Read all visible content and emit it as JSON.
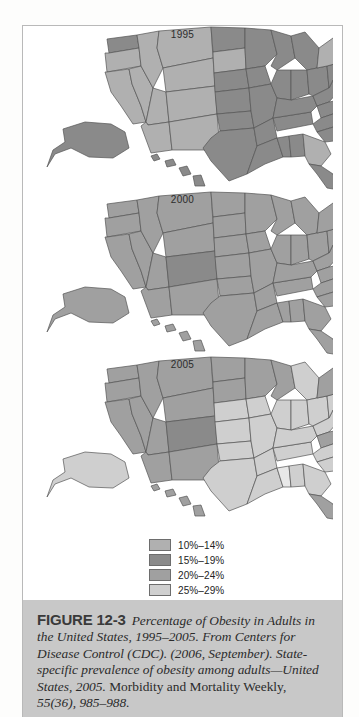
{
  "figure": {
    "number_label": "FIGURE 12-3",
    "caption_italic_1": "Percentage of Obesity in Adults in the United States, 1995–2005. From Centers for Disease Control (CDC). (2006, September). State-specific prevalence of obesity among adults—United States, 2005.",
    "caption_roman_1": " Morbidity and Mortality Weekly, ",
    "caption_italic_2": "55(36), 985–988."
  },
  "maps": [
    {
      "year": "1995"
    },
    {
      "year": "2000"
    },
    {
      "year": "2005"
    }
  ],
  "legend": {
    "items": [
      {
        "label": "10%–14%",
        "color": "#b0b0b0"
      },
      {
        "label": "15%–19%",
        "color": "#8a8a8a"
      },
      {
        "label": "20%–24%",
        "color": "#a0a0a0"
      },
      {
        "label": "25%–29%",
        "color": "#cfcfcf"
      },
      {
        "label": "≥30%",
        "color": "#e8e8e8"
      }
    ]
  },
  "map_data": {
    "type": "choropleth",
    "title": "Percentage of Obesity in Adults in the United States, 1995–2005",
    "region": "United States",
    "categories": [
      "10%–14%",
      "15%–19%",
      "20%–24%",
      "25%–29%",
      "≥30%"
    ],
    "colors": [
      "#b0b0b0",
      "#8a8a8a",
      "#a0a0a0",
      "#cfcfcf",
      "#e8e8e8"
    ],
    "frames": [
      {
        "year": "1995",
        "values": {
          "WA": "15%–19%",
          "OR": "10%–14%",
          "CA": "10%–14%",
          "NV": "10%–14%",
          "ID": "10%–14%",
          "MT": "10%–14%",
          "WY": "10%–14%",
          "UT": "10%–14%",
          "AZ": "10%–14%",
          "CO": "10%–14%",
          "NM": "10%–14%",
          "ND": "15%–19%",
          "SD": "10%–14%",
          "NE": "15%–19%",
          "KS": "15%–19%",
          "OK": "15%–19%",
          "TX": "15%–19%",
          "MN": "15%–19%",
          "IA": "15%–19%",
          "MO": "15%–19%",
          "AR": "15%–19%",
          "LA": "15%–19%",
          "WI": "15%–19%",
          "IL": "15%–19%",
          "MS": "15%–19%",
          "AL": "15%–19%",
          "TN": "15%–19%",
          "KY": "15%–19%",
          "IN": "15%–19%",
          "MI": "15%–19%",
          "OH": "15%–19%",
          "WV": "15%–19%",
          "VA": "15%–19%",
          "NC": "15%–19%",
          "SC": "15%–19%",
          "GA": "10%–14%",
          "FL": "15%–19%",
          "PA": "15%–19%",
          "NY": "10%–14%",
          "ME": "10%–14%",
          "VT": "10%–14%",
          "NH": "10%–14%",
          "MA": "10%–14%",
          "RI": "10%–14%",
          "CT": "10%–14%",
          "NJ": "15%–19%",
          "DE": "15%–19%",
          "MD": "10%–14%",
          "AK": "15%–19%",
          "HI": "15%–19%"
        }
      },
      {
        "year": "2000",
        "values": {
          "WA": "20%–24%",
          "OR": "20%–24%",
          "CA": "20%–24%",
          "NV": "20%–24%",
          "ID": "20%–24%",
          "MT": "20%–24%",
          "WY": "20%–24%",
          "UT": "20%–24%",
          "AZ": "20%–24%",
          "CO": "15%–19%",
          "NM": "20%–24%",
          "ND": "20%–24%",
          "SD": "20%–24%",
          "NE": "20%–24%",
          "KS": "20%–24%",
          "OK": "20%–24%",
          "TX": "20%–24%",
          "MN": "20%–24%",
          "IA": "20%–24%",
          "MO": "20%–24%",
          "AR": "20%–24%",
          "LA": "20%–24%",
          "WI": "20%–24%",
          "IL": "20%–24%",
          "MS": "20%–24%",
          "AL": "20%–24%",
          "TN": "20%–24%",
          "KY": "20%–24%",
          "IN": "20%–24%",
          "MI": "20%–24%",
          "OH": "20%–24%",
          "WV": "20%–24%",
          "VA": "20%–24%",
          "NC": "20%–24%",
          "SC": "20%–24%",
          "GA": "20%–24%",
          "FL": "20%–24%",
          "PA": "20%–24%",
          "NY": "20%–24%",
          "ME": "20%–24%",
          "VT": "20%–24%",
          "NH": "20%–24%",
          "MA": "20%–24%",
          "RI": "20%–24%",
          "CT": "20%–24%",
          "NJ": "20%–24%",
          "DE": "20%–24%",
          "MD": "20%–24%",
          "AK": "20%–24%",
          "HI": "20%–24%"
        }
      },
      {
        "year": "2005",
        "values": {
          "WA": "20%–24%",
          "OR": "20%–24%",
          "CA": "20%–24%",
          "NV": "20%–24%",
          "ID": "20%–24%",
          "MT": "20%–24%",
          "WY": "20%–24%",
          "UT": "20%–24%",
          "AZ": "20%–24%",
          "CO": "15%–19%",
          "NM": "20%–24%",
          "ND": "20%–24%",
          "SD": "20%–24%",
          "NE": "25%–29%",
          "KS": "25%–29%",
          "OK": "25%–29%",
          "TX": "25%–29%",
          "MN": "20%–24%",
          "IA": "25%–29%",
          "MO": "25%–29%",
          "AR": "25%–29%",
          "LA": "25%–29%",
          "WI": "20%–24%",
          "IL": "25%–29%",
          "MS": "≥30%",
          "AL": "25%–29%",
          "TN": "25%–29%",
          "KY": "25%–29%",
          "IN": "25%–29%",
          "MI": "25%–29%",
          "OH": "25%–29%",
          "WV": "25%–29%",
          "VA": "20%–24%",
          "NC": "25%–29%",
          "SC": "25%–29%",
          "GA": "25%–29%",
          "FL": "20%–24%",
          "PA": "25%–29%",
          "NY": "20%–24%",
          "ME": "20%–24%",
          "VT": "20%–24%",
          "NH": "20%–24%",
          "MA": "20%–24%",
          "RI": "20%–24%",
          "CT": "20%–24%",
          "NJ": "20%–24%",
          "DE": "20%–24%",
          "MD": "20%–24%",
          "AK": "25%–29%",
          "HI": "20%–24%"
        }
      }
    ]
  }
}
